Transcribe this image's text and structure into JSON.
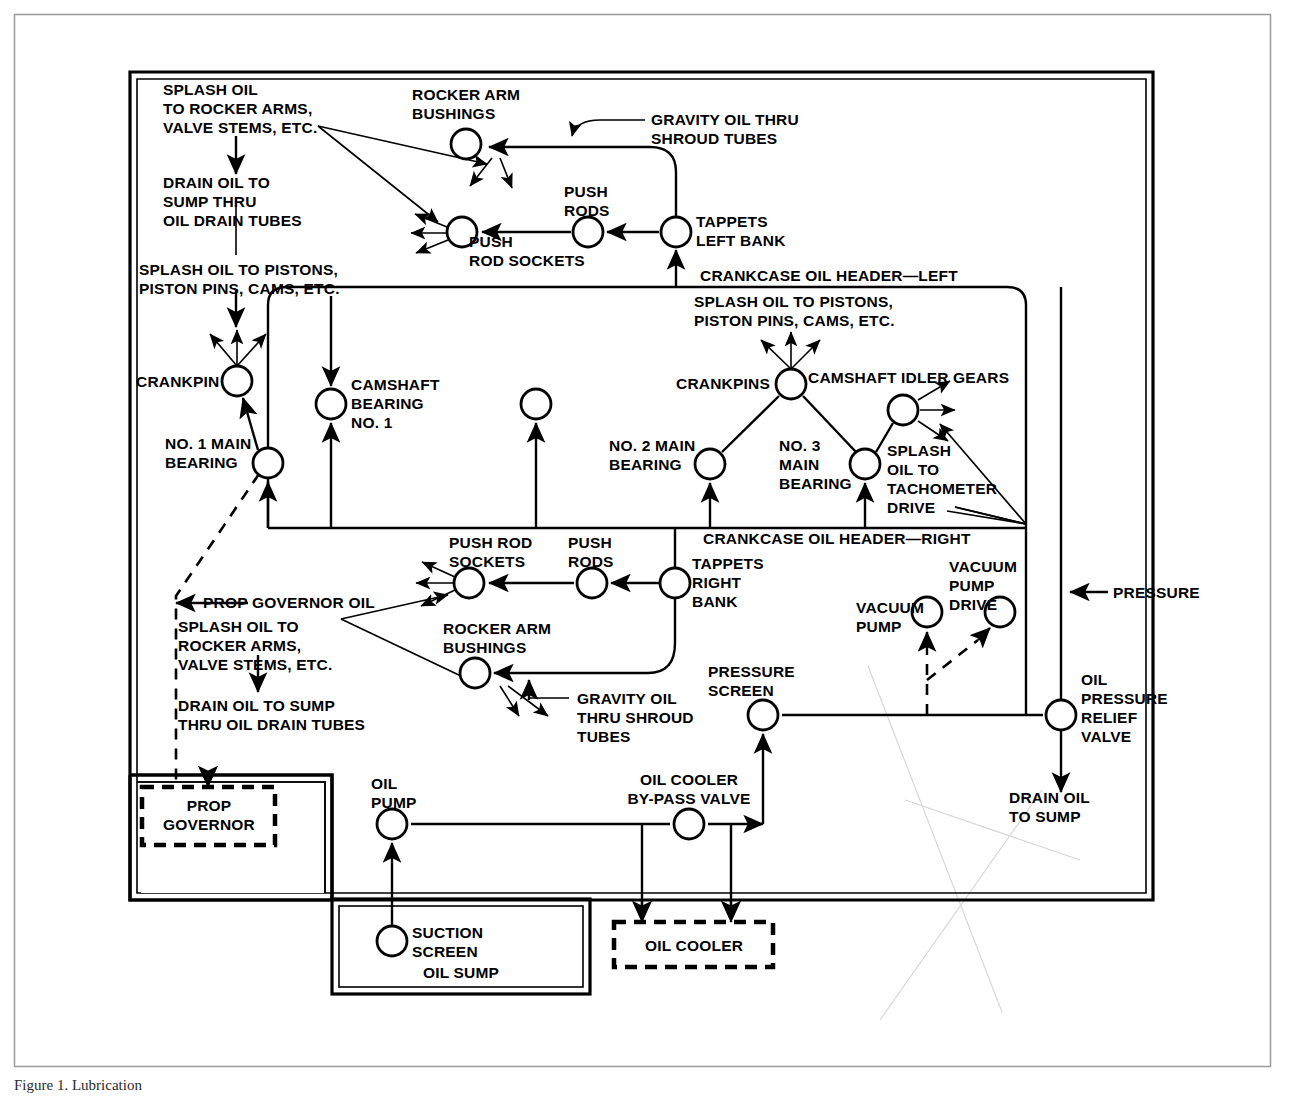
{
  "figure": {
    "domain": "diagram",
    "kind": "engine-lubrication-schematic",
    "caption": "Figure  1.  Lubrication",
    "colors": {
      "ink": "#000000",
      "paper": "#ffffff",
      "frame": "#9b9b9b"
    }
  },
  "labels": {
    "splash_rocker_left": "SPLASH OIL\nTO ROCKER ARMS,\nVALVE STEMS, ETC.",
    "drain_sump_left": "DRAIN OIL TO\nSUMP THRU\nOIL DRAIN TUBES",
    "splash_pistons_left": "SPLASH OIL TO PISTONS,\nPISTON PINS, CAMS, ETC.",
    "rocker_arm_bushings_top": "ROCKER ARM\nBUSHINGS",
    "gravity_oil_top": "GRAVITY OIL THRU\nSHROUD TUBES",
    "push_rods_top": "PUSH\nRODS",
    "push_rod_sockets_top": "PUSH\nROD SOCKETS",
    "tappets_left_bank": "TAPPETS\nLEFT BANK",
    "crankcase_header_left": "CRANKCASE OIL HEADER—LEFT",
    "splash_pistons_right": "SPLASH OIL TO PISTONS,\nPISTON PINS, CAMS, ETC.",
    "crankpin": "CRANKPIN",
    "camshaft_bearing_no1": "CAMSHAFT\nBEARING\nNO. 1",
    "no1_main_bearing": "NO. 1 MAIN\nBEARING",
    "crankpins": "CRANKPINS",
    "camshaft_idler_gears": "CAMSHAFT IDLER GEARS",
    "no2_main_bearing": "NO. 2 MAIN\nBEARING",
    "no3_main_bearing": "NO. 3\nMAIN\nBEARING",
    "splash_tachometer": "SPLASH\nOIL TO\nTACHOMETER\nDRIVE",
    "crankcase_header_right": "CRANKCASE OIL HEADER—RIGHT",
    "push_rod_sockets_bottom": "PUSH ROD\nSOCKETS",
    "push_rods_bottom": "PUSH\nRODS",
    "tappets_right_bank": "TAPPETS\nRIGHT\nBANK",
    "prop_governor_oil": "PROP GOVERNOR OIL",
    "splash_rocker_bottom": "SPLASH OIL TO\nROCKER ARMS,\nVALVE STEMS, ETC.",
    "rocker_arm_bushings_bottom": "ROCKER ARM\nBUSHINGS",
    "gravity_oil_bottom": "GRAVITY OIL\nTHRU SHROUD\nTUBES",
    "drain_sump_bottom": "DRAIN OIL TO SUMP\nTHRU OIL DRAIN TUBES",
    "pressure_screen": "PRESSURE\nSCREEN",
    "vacuum_pump": "VACUUM\nPUMP",
    "vacuum_pump_drive": "VACUUM\nPUMP\nDRIVE",
    "pressure": "PRESSURE",
    "oil_pressure_relief_valve": "OIL\nPRESSURE\nRELIEF\nVALVE",
    "drain_oil_to_sump": "DRAIN OIL\nTO SUMP",
    "prop_governor": "PROP\nGOVERNOR",
    "oil_pump": "OIL\nPUMP",
    "oil_cooler_bypass_valve": "OIL COOLER\nBY-PASS VALVE",
    "suction_screen": "SUCTION\nSCREEN",
    "oil_sump": "OIL SUMP",
    "oil_cooler": "OIL COOLER"
  },
  "nodes": [
    {
      "id": "rocker-arm-bushings-top",
      "label": "ROCKER ARM BUSHINGS",
      "x": 466,
      "y": 144,
      "r": 15
    },
    {
      "id": "push-rods-top",
      "label": "PUSH RODS",
      "x": 588,
      "y": 232,
      "r": 15
    },
    {
      "id": "push-rod-sockets-top",
      "label": "PUSH ROD SOCKETS",
      "x": 462,
      "y": 232,
      "r": 15
    },
    {
      "id": "tappets-left-bank",
      "label": "TAPPETS LEFT BANK",
      "x": 676,
      "y": 232,
      "r": 15
    },
    {
      "id": "crankpin",
      "label": "CRANKPIN",
      "x": 237,
      "y": 381,
      "r": 15
    },
    {
      "id": "camshaft-bearing-no1",
      "label": "CAMSHAFT BEARING NO. 1",
      "x": 331,
      "y": 404,
      "r": 15
    },
    {
      "id": "camshaft-bearing-unlabeled",
      "label": "",
      "x": 536,
      "y": 404,
      "r": 15
    },
    {
      "id": "no1-main-bearing",
      "label": "NO. 1 MAIN BEARING",
      "x": 268,
      "y": 463,
      "r": 15
    },
    {
      "id": "crankpins",
      "label": "CRANKPINS",
      "x": 791,
      "y": 384,
      "r": 15
    },
    {
      "id": "camshaft-idler-gears",
      "label": "CAMSHAFT IDLER GEARS",
      "x": 903,
      "y": 410,
      "r": 15
    },
    {
      "id": "no2-main-bearing",
      "label": "NO. 2 MAIN BEARING",
      "x": 710,
      "y": 464,
      "r": 15
    },
    {
      "id": "no3-main-bearing",
      "label": "NO. 3 MAIN BEARING",
      "x": 865,
      "y": 464,
      "r": 15
    },
    {
      "id": "push-rod-sockets-bottom",
      "label": "PUSH ROD SOCKETS",
      "x": 469,
      "y": 583,
      "r": 15
    },
    {
      "id": "push-rods-bottom",
      "label": "PUSH RODS",
      "x": 592,
      "y": 583,
      "r": 15
    },
    {
      "id": "tappets-right-bank",
      "label": "TAPPETS RIGHT BANK",
      "x": 675,
      "y": 583,
      "r": 15
    },
    {
      "id": "rocker-arm-bushings-bottom",
      "label": "ROCKER ARM BUSHINGS",
      "x": 475,
      "y": 673,
      "r": 15
    },
    {
      "id": "pressure-screen",
      "label": "PRESSURE SCREEN",
      "x": 763,
      "y": 715,
      "r": 15
    },
    {
      "id": "vacuum-pump",
      "label": "VACUUM PUMP",
      "x": 927,
      "y": 612,
      "r": 15
    },
    {
      "id": "vacuum-pump-drive",
      "label": "VACUUM PUMP DRIVE",
      "x": 1000,
      "y": 612,
      "r": 15
    },
    {
      "id": "oil-pressure-relief-valve",
      "label": "OIL PRESSURE RELIEF VALVE",
      "x": 1061,
      "y": 715,
      "r": 15
    },
    {
      "id": "oil-pump",
      "label": "OIL PUMP",
      "x": 392,
      "y": 824,
      "r": 15
    },
    {
      "id": "oil-cooler-bypass-valve",
      "label": "OIL COOLER BY-PASS VALVE",
      "x": 689,
      "y": 824,
      "r": 15
    },
    {
      "id": "suction-screen",
      "label": "SUCTION SCREEN",
      "x": 392,
      "y": 941,
      "r": 15
    }
  ],
  "containers": [
    {
      "id": "engine-block",
      "label": "",
      "x": 130,
      "y": 72,
      "w": 1023,
      "h": 828
    },
    {
      "id": "oil-sump-box",
      "label": "OIL SUMP",
      "x": 332,
      "y": 899,
      "w": 258,
      "h": 95
    },
    {
      "id": "prop-governor-box",
      "label": "PROP GOVERNOR",
      "x": 142,
      "y": 787,
      "w": 133,
      "h": 58,
      "style": "dashed"
    },
    {
      "id": "oil-cooler-box",
      "label": "OIL COOLER",
      "x": 614,
      "y": 922,
      "w": 159,
      "h": 45,
      "style": "dashed"
    },
    {
      "id": "page-frame",
      "label": "",
      "x": 14,
      "y": 14,
      "w": 1256,
      "h": 1052
    }
  ]
}
